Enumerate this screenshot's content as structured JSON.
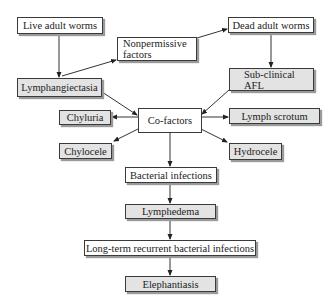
{
  "diagram": {
    "type": "flowchart",
    "colors": {
      "outline": "#3a3a3a",
      "highlight_fill": "#e3e3e3",
      "plain_fill": "#ffffff",
      "shadow": "#9a9a9a"
    },
    "nodes": {
      "live_adult_worms": {
        "label": "Live adult worms",
        "style": "plain"
      },
      "nonpermissive": {
        "line1": "Nonpermissive",
        "line2": "factors",
        "style": "plain"
      },
      "dead_adult_worms": {
        "label": "Dead adult worms",
        "style": "plain"
      },
      "lymphangiectasia": {
        "label": "Lymphangiectasia",
        "style": "highlight"
      },
      "subclinical_afl": {
        "line1": "Sub-clinical",
        "line2": "AFL",
        "style": "highlight"
      },
      "cofactors": {
        "label": "Co-factors",
        "style": "plain"
      },
      "chyluria": {
        "label": "Chyluria",
        "style": "highlight"
      },
      "lymph_scrotum": {
        "label": "Lymph scrotum",
        "style": "highlight"
      },
      "chylocele": {
        "label": "Chylocele",
        "style": "highlight"
      },
      "hydrocele": {
        "label": "Hydrocele",
        "style": "highlight"
      },
      "bacterial_infections": {
        "label": "Bacterial infections",
        "style": "plain"
      },
      "lymphedema": {
        "label": "Lymphedema",
        "style": "highlight"
      },
      "long_term": {
        "label": "Long-term recurrent bacterial infections",
        "style": "plain"
      },
      "elephantiasis": {
        "label": "Elephantiasis",
        "style": "highlight"
      }
    },
    "edges": [
      {
        "from": "Live adult worms",
        "to": "Lymphangiectasia"
      },
      {
        "from": "Lymphangiectasia",
        "to": "Nonpermissive factors"
      },
      {
        "from": "Nonpermissive factors",
        "to": "Dead adult worms"
      },
      {
        "from": "Dead adult worms",
        "to": "Sub-clinical AFL"
      },
      {
        "from": "Lymphangiectasia",
        "to": "Co-factors"
      },
      {
        "from": "Sub-clinical AFL",
        "to": "Co-factors"
      },
      {
        "from": "Co-factors",
        "to": "Chyluria"
      },
      {
        "from": "Co-factors",
        "to": "Lymph scrotum"
      },
      {
        "from": "Co-factors",
        "to": "Chylocele"
      },
      {
        "from": "Co-factors",
        "to": "Hydrocele"
      },
      {
        "from": "Co-factors",
        "to": "Bacterial infections"
      },
      {
        "from": "Bacterial infections",
        "to": "Lymphedema"
      },
      {
        "from": "Lymphedema",
        "to": "Long-term recurrent bacterial infections"
      },
      {
        "from": "Long-term recurrent bacterial infections",
        "to": "Elephantiasis"
      }
    ]
  }
}
